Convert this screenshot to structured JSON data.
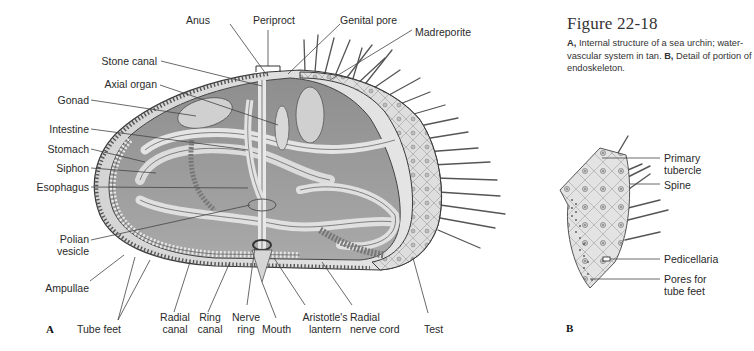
{
  "figure": {
    "title": "Figure 22-18",
    "caption": {
      "part_a_letter": "A,",
      "part_a_text": " Internal structure of a sea urchin; water-vascular system in tan. ",
      "part_b_letter": "B,",
      "part_b_text": " Detail of portion of endoskeleton."
    }
  },
  "panel_a": {
    "letter": "A",
    "labels": {
      "anus": "Anus",
      "periproct": "Periproct",
      "genital_pore": "Genital pore",
      "madreporite": "Madreporite",
      "stone_canal": "Stone canal",
      "axial_organ": "Axial organ",
      "gonad": "Gonad",
      "intestine": "Intestine",
      "stomach": "Stomach",
      "siphon": "Siphon",
      "esophagus": "Esophagus",
      "polian_vesicle_1": "Polian",
      "polian_vesicle_2": "vesicle",
      "ampullae": "Ampullae",
      "tube_feet": "Tube feet",
      "radial_canal_1": "Radial",
      "radial_canal_2": "canal",
      "ring_canal_1": "Ring",
      "ring_canal_2": "canal",
      "nerve_ring_1": "Nerve",
      "nerve_ring_2": "ring",
      "mouth": "Mouth",
      "aristotles_lantern_1": "Aristotle's",
      "aristotles_lantern_2": "lantern",
      "radial_nerve_cord_1": "Radial",
      "radial_nerve_cord_2": "nerve cord",
      "test": "Test"
    }
  },
  "panel_b": {
    "letter": "B",
    "labels": {
      "primary_tubercle_1": "Primary",
      "primary_tubercle_2": "tubercle",
      "spine": "Spine",
      "pedicellaria": "Pedicellaria",
      "pores_1": "Pores for",
      "pores_2": "tube feet"
    }
  },
  "colors": {
    "shell_light": "#d9d9d9",
    "shell_mid": "#b5b5b5",
    "shell_dark": "#7a7a7a",
    "outline": "#3a3a3a",
    "text": "#2a2a2a"
  }
}
